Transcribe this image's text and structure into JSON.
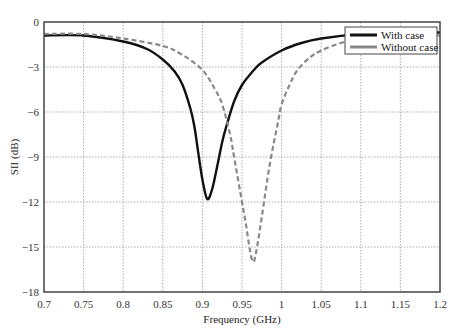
{
  "chart_data": {
    "type": "line",
    "title": "",
    "xlabel": "Frequency (GHz)",
    "ylabel": "SII (dB)",
    "xlim": [
      0.7,
      1.2
    ],
    "ylim": [
      -18,
      0
    ],
    "xticks": [
      "0.7",
      "0.75",
      "0.8",
      "0.85",
      "0.9",
      "0.95",
      "1",
      "1.05",
      "1.1",
      "1.15",
      "1.2"
    ],
    "yticks": [
      "0",
      "−3",
      "−6",
      "−9",
      "−12",
      "−15",
      "−18"
    ],
    "grid": true,
    "legend_position": "upper right",
    "series": [
      {
        "name": "With case",
        "style": "solid",
        "color": "#111111",
        "x": [
          0.7,
          0.75,
          0.8,
          0.83,
          0.85,
          0.865,
          0.875,
          0.885,
          0.89,
          0.895,
          0.9,
          0.906,
          0.912,
          0.918,
          0.925,
          0.93,
          0.94,
          0.95,
          0.965,
          0.975,
          1.0,
          1.025,
          1.05,
          1.1,
          1.15,
          1.2
        ],
        "y": [
          -0.9,
          -0.9,
          -1.3,
          -1.8,
          -2.5,
          -3.3,
          -4.2,
          -5.8,
          -7.0,
          -8.8,
          -10.5,
          -11.8,
          -11.2,
          -9.8,
          -8.0,
          -7.0,
          -5.3,
          -4.2,
          -3.2,
          -2.7,
          -1.9,
          -1.4,
          -1.1,
          -0.8,
          -0.7,
          -0.7
        ]
      },
      {
        "name": "Without case",
        "style": "dashed",
        "color": "#888888",
        "x": [
          0.7,
          0.75,
          0.8,
          0.85,
          0.875,
          0.9,
          0.915,
          0.925,
          0.935,
          0.94,
          0.95,
          0.955,
          0.96,
          0.964,
          0.968,
          0.975,
          0.985,
          0.995,
          1.0,
          1.01,
          1.02,
          1.035,
          1.05,
          1.075,
          1.1,
          1.15,
          1.2
        ],
        "y": [
          -0.8,
          -0.8,
          -1.1,
          -1.6,
          -2.2,
          -3.2,
          -4.4,
          -5.5,
          -7.5,
          -9.0,
          -12.0,
          -13.5,
          -15.2,
          -16.0,
          -15.3,
          -13.0,
          -9.5,
          -6.8,
          -5.5,
          -4.2,
          -3.2,
          -2.4,
          -1.9,
          -1.4,
          -1.1,
          -0.9,
          -0.9
        ]
      }
    ]
  }
}
